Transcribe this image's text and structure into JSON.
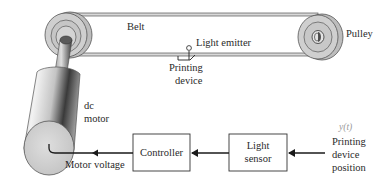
{
  "diagram": {
    "mechanical": {
      "belt_label": "Belt",
      "pulley_label": "Pulley",
      "light_emitter_label": "Light emitter",
      "printing_device_label_line1": "Printing",
      "printing_device_label_line2": "device",
      "motor_label_line1": "dc",
      "motor_label_line2": "motor"
    },
    "blocks": [
      {
        "id": "controller",
        "label": "Controller"
      },
      {
        "id": "light-sensor",
        "label_line1": "Light",
        "label_line2": "sensor"
      }
    ],
    "signals": {
      "motor_voltage_label": "Motor voltage",
      "output_symbol": "y(t)",
      "output_label_line1": "Printing",
      "output_label_line2": "device",
      "output_label_line3": "position"
    },
    "flow": [
      {
        "from": "printing-device-position",
        "to": "light-sensor"
      },
      {
        "from": "light-sensor",
        "to": "controller"
      },
      {
        "from": "controller",
        "to": "dc-motor",
        "label": "Motor voltage"
      }
    ],
    "colors": {
      "line": "#1a1a1a",
      "pulley_fill": "#c9c9c9",
      "pulley_ring": "#8a8a8a",
      "motor_light": "#e6e6e6",
      "motor_dark": "#3c3c3c",
      "motor_face": "#d6d6d6",
      "symbol_gray": "#9a9a9a"
    }
  }
}
